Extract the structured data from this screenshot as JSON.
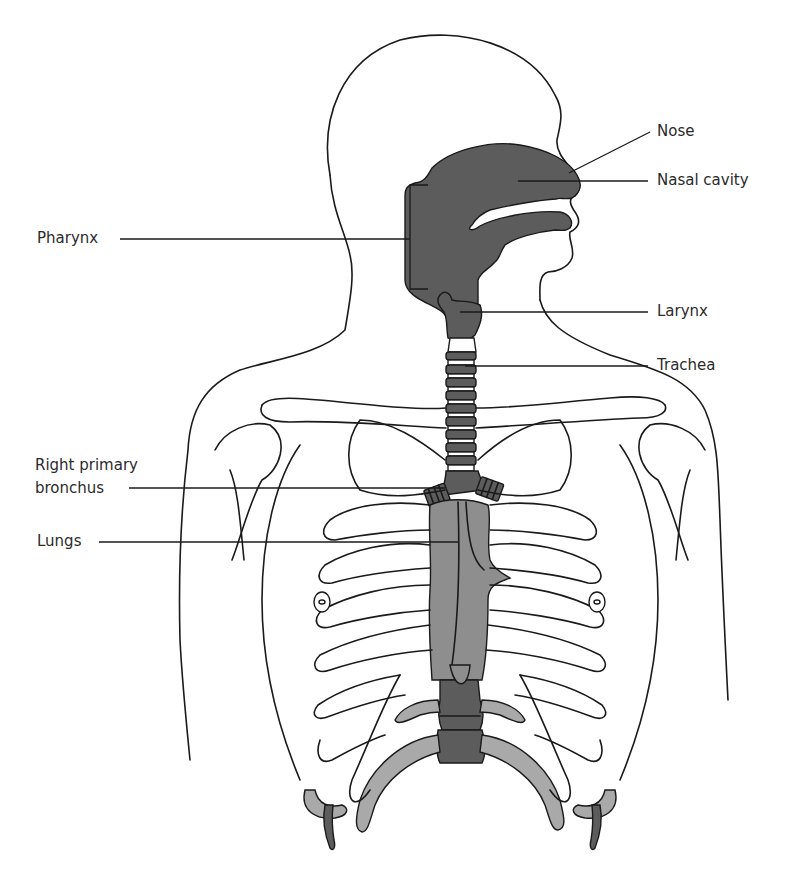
{
  "figure": {
    "labels": {
      "nose": "Nose",
      "nasal_cavity": "Nasal cavity",
      "pharynx": "Pharynx",
      "larynx": "Larynx",
      "trachea": "Trachea",
      "right_primary_bronchus_line1": "Right primary",
      "right_primary_bronchus_line2": "bronchus",
      "lungs": "Lungs"
    },
    "colors": {
      "outline": "#1a1a1a",
      "airway_dark": "#5c5c5c",
      "lung_mid": "#8e8e8e",
      "rib_light": "#a9a9a9",
      "background": "#ffffff"
    }
  }
}
